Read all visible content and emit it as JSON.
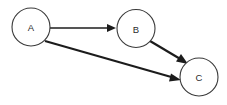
{
  "diagram": {
    "type": "directed-graph",
    "background_color": "#ffffff",
    "node_fill_color": "#ffffff",
    "node_stroke_color": "#3a3a3a",
    "edge_color": "#1c1c1c",
    "label_color": "#2b2b2b",
    "nodes": [
      {
        "id": "A",
        "label": "A",
        "cx": 31,
        "cy": 27,
        "r": 19
      },
      {
        "id": "B",
        "label": "B",
        "cx": 136,
        "cy": 28.5,
        "r": 19
      },
      {
        "id": "C",
        "label": "C",
        "cx": 199,
        "cy": 77,
        "r": 19
      }
    ],
    "edges": [
      {
        "id": "A-B",
        "from": "A",
        "to": "B",
        "label": "",
        "weight": "thin",
        "x1": 50,
        "y1": 28,
        "x2": 113,
        "y2": 28,
        "arrow": "triangle"
      },
      {
        "id": "B-C",
        "from": "B",
        "to": "C",
        "label": "",
        "weight": "thick",
        "x1": 150,
        "y1": 42,
        "x2": 186,
        "y2": 63,
        "arrow": "triangle"
      },
      {
        "id": "A-C",
        "from": "A",
        "to": "C",
        "label": "",
        "weight": "thick",
        "x1": 45,
        "y1": 41,
        "x2": 179,
        "y2": 79,
        "arrow": "triangle"
      }
    ]
  }
}
